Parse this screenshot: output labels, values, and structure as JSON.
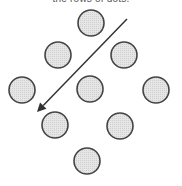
{
  "caption": "the rows of dots.",
  "diagram": {
    "type": "dot-grid-diamond",
    "dot_radius": 13,
    "dot_fill": "#e2e2e2",
    "dot_stroke": "#444444",
    "dots": [
      {
        "cx": 91,
        "cy": 23
      },
      {
        "cx": 58,
        "cy": 55
      },
      {
        "cx": 124,
        "cy": 55
      },
      {
        "cx": 22,
        "cy": 90
      },
      {
        "cx": 90,
        "cy": 89
      },
      {
        "cx": 156,
        "cy": 90
      },
      {
        "cx": 55,
        "cy": 125
      },
      {
        "cx": 120,
        "cy": 126
      },
      {
        "cx": 87,
        "cy": 161
      }
    ],
    "arrow": {
      "x1": 127,
      "y1": 19,
      "x2": 37,
      "y2": 112,
      "color": "#333333",
      "direction": "down-left"
    }
  }
}
